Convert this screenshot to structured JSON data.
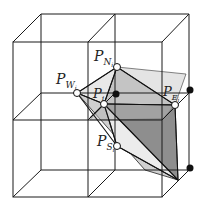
{
  "diagram": {
    "type": "3d-grid-mesh",
    "colors": {
      "grid_line": "#1a1a1a",
      "light_fill": "#e4e4e4",
      "mid_fill": "#c4c4c4",
      "dark_fill": "#8e8e8e",
      "hollow_point": "#ffffff",
      "solid_point": "#111111"
    },
    "labels": {
      "p_n": {
        "base": "P",
        "sub": "N",
        "subsub": "i"
      },
      "p_w": {
        "base": "P",
        "sub": "W",
        "subsub": "i"
      },
      "p_i": {
        "base": "P",
        "sub": "i",
        "subsub": ""
      },
      "p_e": {
        "base": "P",
        "sub": "E",
        "subsub": "i"
      },
      "p_s": {
        "base": "P",
        "sub": "S",
        "subsub": "i"
      }
    },
    "hollow_points": [
      "P_Ni",
      "P_Wi",
      "P_i",
      "P_Ei",
      "P_Si"
    ],
    "solid_points_count": 3
  }
}
